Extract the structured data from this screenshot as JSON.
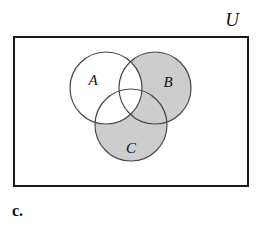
{
  "figure": {
    "caption": "c.",
    "universe_label": "U"
  },
  "sets": [
    {
      "id": "A",
      "label": "A",
      "shaded": false,
      "cx": 106,
      "cy": 88,
      "r": 36,
      "label_x": 93,
      "label_y": 82
    },
    {
      "id": "B",
      "label": "B",
      "shaded": true,
      "cx": 155,
      "cy": 88,
      "r": 36,
      "label_x": 168,
      "label_y": 84
    },
    {
      "id": "C",
      "label": "C",
      "shaded": true,
      "cx": 131,
      "cy": 125,
      "r": 36,
      "label_x": 131,
      "label_y": 150
    }
  ],
  "universe": {
    "label": "U",
    "rect": {
      "x": 14,
      "y": 37,
      "width": 234,
      "height": 149
    },
    "label_x": 232,
    "label_y": 22
  },
  "shading": {
    "description": "(B union C) minus A",
    "shaded_regions": [
      "B only",
      "C only",
      "B and C not A"
    ],
    "unshaded_regions": [
      "A only",
      "A and B not C",
      "A and C not B",
      "A and B and C"
    ],
    "fill_color": "#cdcdcd",
    "background_color": "#ffffff"
  },
  "style": {
    "outline_color": "#4a4a4a",
    "rect_border_color": "#1a1a1a",
    "text_color": "#101010",
    "circle_stroke_width": 1.2,
    "rect_stroke_width": 2
  },
  "chart_data": {
    "type": "diagram",
    "diagram_type": "venn",
    "set_count": 3,
    "title": "",
    "sets": [
      "A",
      "B",
      "C"
    ],
    "universe": "U",
    "shaded_expression": "(B ∪ C) − A",
    "regions": [
      {
        "name": "A only",
        "shaded": false
      },
      {
        "name": "B only",
        "shaded": true
      },
      {
        "name": "C only",
        "shaded": true
      },
      {
        "name": "A ∩ B",
        "shaded": false
      },
      {
        "name": "A ∩ C",
        "shaded": false
      },
      {
        "name": "B ∩ C",
        "shaded": true
      },
      {
        "name": "A ∩ B ∩ C",
        "shaded": false
      },
      {
        "name": "outside all",
        "shaded": false
      }
    ]
  }
}
